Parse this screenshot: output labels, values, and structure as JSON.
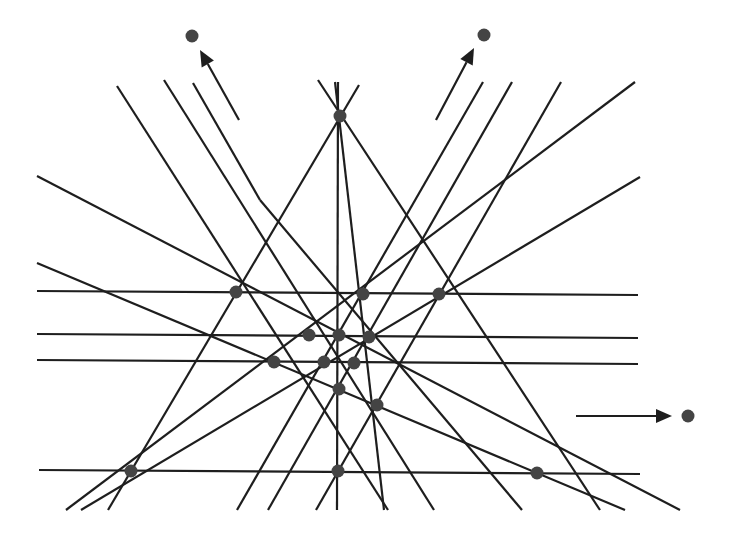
{
  "diagram": {
    "type": "line-arrangement",
    "colors": {
      "line": "#1e1e1e",
      "point": "#444444",
      "background": "#ffffff"
    },
    "point_radius": 6.5,
    "points": [
      {
        "id": "T",
        "x": 340,
        "y": 116
      },
      {
        "id": "A",
        "x": 236,
        "y": 292
      },
      {
        "id": "B",
        "x": 363,
        "y": 294
      },
      {
        "id": "C",
        "x": 439,
        "y": 294
      },
      {
        "id": "D",
        "x": 309,
        "y": 335
      },
      {
        "id": "E",
        "x": 339,
        "y": 335
      },
      {
        "id": "F",
        "x": 369,
        "y": 337
      },
      {
        "id": "G",
        "x": 274,
        "y": 362
      },
      {
        "id": "H",
        "x": 324,
        "y": 362
      },
      {
        "id": "I",
        "x": 354,
        "y": 363
      },
      {
        "id": "J",
        "x": 339,
        "y": 389
      },
      {
        "id": "K",
        "x": 377,
        "y": 405
      },
      {
        "id": "L",
        "x": 131,
        "y": 471
      },
      {
        "id": "M",
        "x": 338,
        "y": 471
      },
      {
        "id": "N",
        "x": 537,
        "y": 473
      }
    ],
    "points_at_infinity": [
      {
        "id": "P1",
        "x": 192,
        "y": 36,
        "arrow": {
          "x1": 239,
          "y1": 120,
          "x2": 200,
          "y2": 50
        }
      },
      {
        "id": "P2",
        "x": 484,
        "y": 35,
        "arrow": {
          "x1": 436,
          "y1": 120,
          "x2": 474,
          "y2": 48
        }
      },
      {
        "id": "P3",
        "x": 688,
        "y": 416,
        "arrow": {
          "x1": 576,
          "y1": 416,
          "x2": 672,
          "y2": 416
        }
      }
    ],
    "lines": [
      {
        "x1": 37,
        "y1": 291,
        "x2": 638,
        "y2": 295
      },
      {
        "x1": 37,
        "y1": 334,
        "x2": 638,
        "y2": 338
      },
      {
        "x1": 37,
        "y1": 360,
        "x2": 638,
        "y2": 364
      },
      {
        "x1": 39,
        "y1": 470,
        "x2": 640,
        "y2": 474
      },
      {
        "x1": 338,
        "y1": 82,
        "x2": 337,
        "y2": 510
      },
      {
        "x1": 335,
        "y1": 82,
        "x2": 384,
        "y2": 510
      },
      {
        "x1": 318,
        "y1": 80,
        "x2": 600,
        "y2": 510
      },
      {
        "x1": 359,
        "y1": 85,
        "x2": 108,
        "y2": 510
      },
      {
        "x1": 117,
        "y1": 86,
        "x2": 388,
        "y2": 510
      },
      {
        "x1": 164,
        "y1": 80,
        "x2": 434,
        "y2": 510
      },
      {
        "x1": 193,
        "y1": 83,
        "x2": 260,
        "y2": 200
      },
      {
        "x1": 37,
        "y1": 176,
        "x2": 680,
        "y2": 510
      },
      {
        "x1": 37,
        "y1": 263,
        "x2": 625,
        "y2": 510
      },
      {
        "x1": 483,
        "y1": 82,
        "x2": 237,
        "y2": 510
      },
      {
        "x1": 512,
        "y1": 82,
        "x2": 268,
        "y2": 510
      },
      {
        "x1": 561,
        "y1": 82,
        "x2": 316,
        "y2": 510
      },
      {
        "x1": 635,
        "y1": 82,
        "x2": 66,
        "y2": 510
      },
      {
        "x1": 640,
        "y1": 177,
        "x2": 81,
        "y2": 510
      },
      {
        "x1": 260,
        "y1": 200,
        "x2": 522,
        "y2": 510
      }
    ]
  }
}
